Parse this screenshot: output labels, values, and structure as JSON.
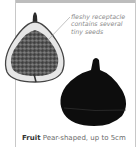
{
  "annotation": {
    "lines": [
      "fleshy receptacle",
      "contains several",
      "tiny seeds"
    ]
  },
  "caption": {
    "label": "Fruit",
    "text": "Pear-shaped, up to 5cm"
  },
  "images": {
    "sliced_fig": "fig-cross-section",
    "whole_fig": "whole-dark-fig"
  }
}
